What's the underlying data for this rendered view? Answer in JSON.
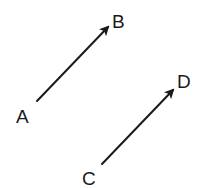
{
  "diagram": {
    "stroke_color": "#1a1a1a",
    "background": "#ffffff",
    "vectors": [
      {
        "name": "AB",
        "from_label": "A",
        "to_label": "B",
        "start": [
          37,
          101
        ],
        "end": [
          108,
          27
        ],
        "from_label_pos": [
          16,
          123
        ],
        "to_label_pos": [
          112,
          28
        ]
      },
      {
        "name": "CD",
        "from_label": "C",
        "to_label": "D",
        "start": [
          102,
          164
        ],
        "end": [
          173,
          90
        ],
        "from_label_pos": [
          82,
          185
        ],
        "to_label_pos": [
          177,
          88
        ]
      }
    ]
  }
}
